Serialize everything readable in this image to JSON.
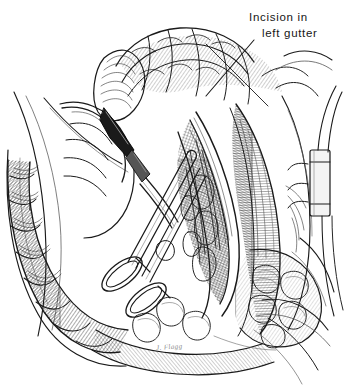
{
  "figure": {
    "domain": "medical-surgical-illustration",
    "technique": "pen-and-ink line drawing with crosshatching",
    "background_color": "#ffffff",
    "ink_color": "#1a1a1a",
    "light_ink_color": "#666666",
    "width": 344,
    "height": 386
  },
  "callout": {
    "line1": "Incision in",
    "line2": "left gutter",
    "leader_line": {
      "from_x": 254,
      "from_y": 40,
      "to_x": 206,
      "to_y": 96
    }
  },
  "signature": {
    "text": "J. Flagg"
  },
  "anatomy": {
    "structures": [
      {
        "name": "descending-colon",
        "description": "haustrated large bowel along left margin, crosshatched"
      },
      {
        "name": "small-bowel-loops",
        "description": "coiled small intestine across upper field"
      },
      {
        "name": "peritoneal-reflection",
        "description": "central elevated fold forming the left paracolic gutter"
      },
      {
        "name": "incision-line",
        "description": "vertical opening in the left paracolic gutter exposing retroperitoneal tissue"
      },
      {
        "name": "retroperitoneal-tissue",
        "description": "vessels and areolar tissue exposed within the incision"
      },
      {
        "name": "omental-fat",
        "description": "lobulated fatty tissue at lower right of field"
      }
    ]
  },
  "instruments": [
    {
      "name": "scalpel",
      "description": "dark blade directed up and to the left at upper left of field"
    },
    {
      "name": "dissecting-forceps",
      "description": "long shafted instrument entering the incision from lower left"
    },
    {
      "name": "ring-handled-clamp",
      "description": "two oval finger rings at lower left"
    },
    {
      "name": "retractor-blade",
      "description": "rectangular retractor at right margin holding back the wound edge"
    }
  ],
  "drapes": [
    {
      "name": "surgical-drape-left",
      "description": "folded drape sweeping down the left edge"
    },
    {
      "name": "surgical-drape-right",
      "description": "draped sheet across the right and lower right of field"
    },
    {
      "name": "surgical-drape-bottom",
      "description": "drape fold crossing the lower border of the field"
    }
  ]
}
